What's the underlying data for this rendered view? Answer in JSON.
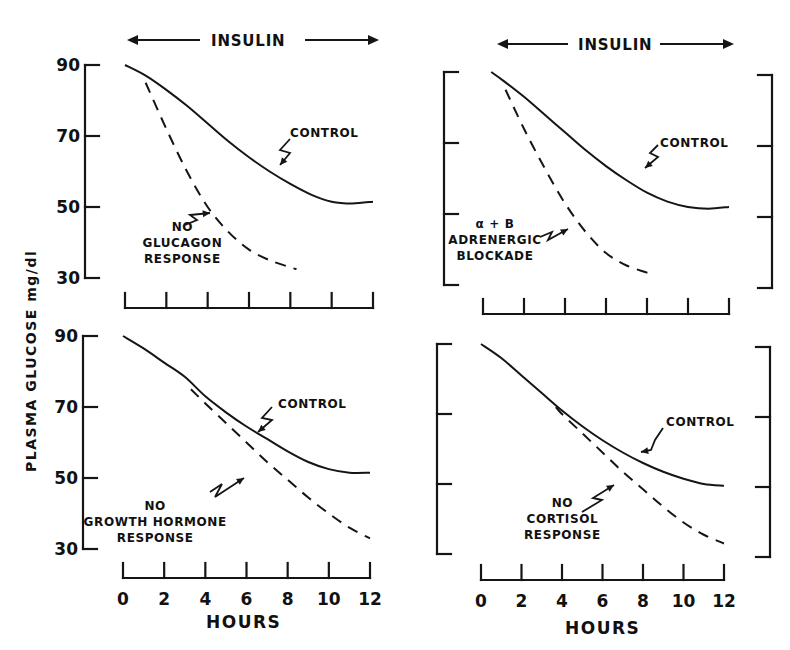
{
  "figure": {
    "y_axis_label": "PLASMA GLUCOSE mg/dl",
    "x_axis_label": "HOURS",
    "insulin_label": "INSULIN",
    "y_ticks": [
      "90",
      "70",
      "50",
      "30"
    ],
    "x_ticks": [
      "0",
      "2",
      "4",
      "6",
      "8",
      "10",
      "12"
    ]
  },
  "chart_data": [
    {
      "type": "line",
      "panel": "top-left",
      "title": "",
      "annotation_top": "INSULIN (infused 0-12 h)",
      "xlabel": "",
      "ylabel": "PLASMA GLUCOSE mg/dl",
      "xlim": [
        0,
        12
      ],
      "ylim": [
        30,
        90
      ],
      "yticks": [
        30,
        50,
        70,
        90
      ],
      "xticks": [
        0,
        2,
        4,
        6,
        8,
        10,
        12
      ],
      "series": [
        {
          "name": "CONTROL",
          "style": "solid",
          "x": [
            0,
            1,
            2,
            3,
            4,
            5,
            6,
            7,
            8,
            9,
            10,
            11,
            12
          ],
          "y": [
            90,
            87,
            83,
            78.5,
            73.5,
            68.5,
            64,
            60,
            56.5,
            53.5,
            51.5,
            51,
            51.5
          ]
        },
        {
          "name": "NO GLUCAGON RESPONSE",
          "style": "dashed",
          "x": [
            1,
            2,
            3,
            4,
            5,
            6,
            7,
            8,
            8.3
          ],
          "y": [
            85,
            72,
            60,
            50,
            43,
            38,
            35,
            33,
            32.5
          ]
        }
      ],
      "labels": {
        "control": "CONTROL",
        "experimental": [
          "NO",
          "GLUCAGON",
          "RESPONSE"
        ]
      }
    },
    {
      "type": "line",
      "panel": "top-right",
      "title": "",
      "annotation_top": "INSULIN (infused 0-12 h)",
      "xlabel": "",
      "ylabel": "",
      "xlim": [
        0,
        12
      ],
      "ylim": [
        30,
        90
      ],
      "yticks": [
        30,
        50,
        70,
        90
      ],
      "xticks": [
        0,
        2,
        4,
        6,
        8,
        10,
        12
      ],
      "series": [
        {
          "name": "CONTROL",
          "style": "solid",
          "x": [
            0.4,
            1,
            2,
            3,
            4,
            5,
            6,
            7,
            8,
            9,
            10,
            11,
            12
          ],
          "y": [
            90,
            87.5,
            83,
            78,
            73,
            68,
            63.5,
            59.5,
            56,
            53.5,
            52,
            51.5,
            52
          ]
        },
        {
          "name": "α+B ADRENERGIC BLOCKADE",
          "style": "dashed",
          "x": [
            1.1,
            2,
            3,
            4,
            5,
            6,
            7,
            8,
            8.2
          ],
          "y": [
            85,
            74,
            63,
            53,
            45,
            39,
            35.5,
            33.5,
            33
          ]
        }
      ],
      "labels": {
        "control": "CONTROL",
        "experimental": [
          "α + B",
          "ADRENERGIC",
          "BLOCKADE"
        ]
      }
    },
    {
      "type": "line",
      "panel": "bottom-left",
      "title": "",
      "xlabel": "HOURS",
      "ylabel": "PLASMA GLUCOSE mg/dl",
      "xlim": [
        0,
        12
      ],
      "ylim": [
        30,
        90
      ],
      "yticks": [
        30,
        50,
        70,
        90
      ],
      "xticks": [
        0,
        2,
        4,
        6,
        8,
        10,
        12
      ],
      "series": [
        {
          "name": "CONTROL",
          "style": "solid",
          "x": [
            0,
            1,
            2,
            3,
            4,
            5,
            6,
            7,
            8,
            9,
            10,
            11,
            12
          ],
          "y": [
            90,
            86.5,
            82.5,
            78.5,
            73,
            68.5,
            64.5,
            61,
            57.5,
            54.5,
            52.5,
            51.5,
            51.5
          ]
        },
        {
          "name": "NO GROWTH HORMONE RESPONSE",
          "style": "dashed",
          "x": [
            3.3,
            4,
            5,
            6,
            7,
            8,
            9,
            10,
            11,
            12
          ],
          "y": [
            75,
            71,
            65.5,
            60,
            54.5,
            49.5,
            44.5,
            40,
            36,
            33
          ]
        }
      ],
      "labels": {
        "control": "CONTROL",
        "experimental": [
          "NO",
          "GROWTH HORMONE",
          "RESPONSE"
        ]
      }
    },
    {
      "type": "line",
      "panel": "bottom-right",
      "title": "",
      "xlabel": "HOURS",
      "ylabel": "",
      "xlim": [
        0,
        12
      ],
      "ylim": [
        30,
        90
      ],
      "yticks": [
        30,
        50,
        70,
        90
      ],
      "xticks": [
        0,
        2,
        4,
        6,
        8,
        10,
        12
      ],
      "series": [
        {
          "name": "CONTROL",
          "style": "solid",
          "x": [
            0,
            1,
            2,
            3,
            4,
            5,
            6,
            7,
            8,
            9,
            10,
            11,
            12
          ],
          "y": [
            90,
            86,
            81,
            76,
            71,
            66.5,
            62.5,
            59,
            56,
            53.5,
            51.5,
            50,
            49.5
          ]
        },
        {
          "name": "NO CORTISOL RESPONSE",
          "style": "dashed",
          "x": [
            3.7,
            4,
            5,
            6,
            7,
            8,
            9,
            10,
            11,
            12
          ],
          "y": [
            72,
            70,
            64.5,
            59,
            53.5,
            48.5,
            43.5,
            39,
            35.5,
            33
          ]
        }
      ],
      "labels": {
        "control": "CONTROL",
        "experimental": [
          "NO",
          "CORTISOL",
          "RESPONSE"
        ]
      }
    }
  ]
}
